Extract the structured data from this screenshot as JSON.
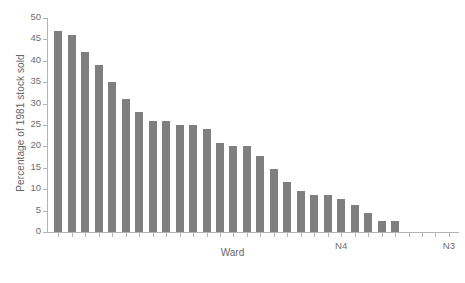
{
  "chart_data": {
    "type": "bar",
    "title": "",
    "subtitle": "",
    "xlabel": "Ward",
    "ylabel": "Percentage of 1981 stock sold",
    "ylim": [
      0,
      50
    ],
    "yticks": [
      0,
      5,
      10,
      15,
      20,
      25,
      30,
      35,
      40,
      45,
      50
    ],
    "grid": false,
    "legend": null,
    "bar_color": "#7f7f7f",
    "axis_color": "#b4b4b4",
    "text_color": "#6e6e6e",
    "categories": [
      "1",
      "2",
      "3",
      "4",
      "5",
      "6",
      "7",
      "8",
      "9",
      "10",
      "11",
      "12",
      "13",
      "14",
      "15",
      "16",
      "17",
      "18",
      "19",
      "20",
      "21",
      "22",
      "23",
      "N4",
      "25",
      "26",
      "27",
      "28",
      "29",
      "N3"
    ],
    "values": [
      47.0,
      46.0,
      42.0,
      39.0,
      35.0,
      31.0,
      28.0,
      26.0,
      26.0,
      25.0,
      25.0,
      24.0,
      20.8,
      20.0,
      20.0,
      17.8,
      14.7,
      11.7,
      9.6,
      8.6,
      8.6,
      7.6,
      6.4,
      4.5,
      2.6,
      2.6,
      0,
      0,
      0,
      0
    ],
    "annotations": [
      {
        "label": "N4",
        "category_index": 21
      },
      {
        "label": "N3",
        "category_index": 29
      }
    ],
    "n_bars": 30
  },
  "axis": {
    "y_title": "Percentage of 1981 stock sold",
    "x_title": "Ward",
    "y_labels": [
      "0",
      "5",
      "10",
      "15",
      "20",
      "25",
      "30",
      "35",
      "40",
      "45",
      "50"
    ],
    "x_labels": [
      "N4",
      "N3"
    ]
  }
}
